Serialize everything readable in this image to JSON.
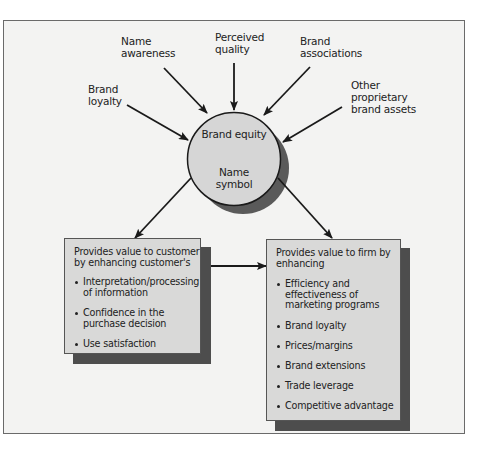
{
  "diagram": {
    "center": {
      "title": "Brand equity",
      "subtitle_line1": "Name",
      "subtitle_line2": "symbol"
    },
    "inputs": [
      {
        "line1": "Brand",
        "line2": "loyalty"
      },
      {
        "line1": "Name",
        "line2": "awareness"
      },
      {
        "line1": "Perceived",
        "line2": "quality"
      },
      {
        "line1": "Brand",
        "line2": "associations"
      },
      {
        "line1": "Other",
        "line2": "proprietary",
        "line3": "brand assets"
      }
    ],
    "customer_box": {
      "heading_line1": "Provides value to customer",
      "heading_line2": "by enhancing customer's",
      "items": [
        "Interpretation/processing\nof information",
        "Confidence in the\npurchase decision",
        "Use satisfaction"
      ]
    },
    "firm_box": {
      "heading_line1": "Provides value to firm by",
      "heading_line2": "enhancing",
      "items": [
        "Efficiency and\neffectiveness of\nmarketing programs",
        "Brand loyalty",
        "Prices/margins",
        "Brand extensions",
        "Trade leverage",
        "Competitive advantage"
      ]
    },
    "colors": {
      "frame_bg": "#f3f3f2",
      "circle_fill": "#d6d6d6",
      "box_fill": "#d9d9d8",
      "shadow": "#4d4d4d",
      "stroke": "#1a1a1a"
    }
  }
}
